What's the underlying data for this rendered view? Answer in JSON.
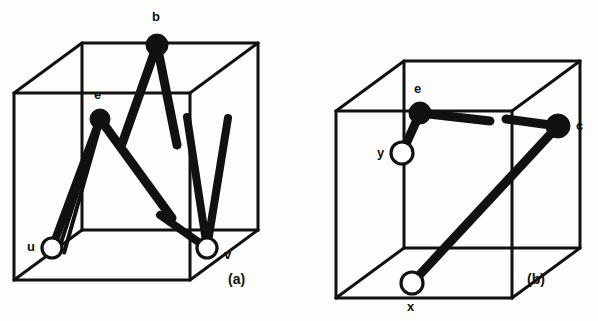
{
  "figure": {
    "title": "",
    "background_color": "#fdfdfb",
    "ink_color": "#111111",
    "panels": [
      {
        "id": "a",
        "caption": "(a)",
        "caption_pos": {
          "x": 228,
          "y": 272
        },
        "cube": {
          "front": {
            "x": 14,
            "y": 93,
            "w": 176,
            "h": 187
          },
          "depth_dx": 68,
          "depth_dy": -50,
          "stroke_width": 3
        },
        "nodes": [
          {
            "id": "b",
            "label": "b",
            "kind": "filled",
            "x": 157,
            "y": 45,
            "r": 11,
            "label_pos": {
              "x": 152,
              "y": 10
            }
          },
          {
            "id": "e",
            "label": "e",
            "kind": "filled",
            "x": 100,
            "y": 119,
            "r": 10,
            "label_pos": {
              "x": 94,
              "y": 88
            }
          },
          {
            "id": "u",
            "label": "u",
            "kind": "open",
            "x": 52,
            "y": 248,
            "r": 10,
            "label_pos": {
              "x": 27,
              "y": 240
            }
          },
          {
            "id": "v",
            "label": "v",
            "kind": "open",
            "x": 207,
            "y": 248,
            "r": 10,
            "label_pos": {
              "x": 224,
              "y": 248
            }
          }
        ],
        "edges": [
          {
            "from": "b",
            "to": [
              122,
              144
            ],
            "width": 9,
            "note": "b leg down-left"
          },
          {
            "from": "b",
            "to": [
              177,
              145
            ],
            "width": 9,
            "note": "b leg down-right"
          },
          {
            "from": "e",
            "to": [
              52,
              248
            ],
            "width": 8,
            "note": "e to u (thick)"
          },
          {
            "from": "e",
            "to": [
              52,
              248
            ],
            "width": 4,
            "offset": -7,
            "note": "e to u (second strand)"
          },
          {
            "from": "e",
            "to": [
              52,
              248
            ],
            "width": 4,
            "offset": -13,
            "note": "e to u (third strand)"
          },
          {
            "from": "e",
            "to": [
              172,
              218
            ],
            "width": 9,
            "note": "e diagonal down-right"
          },
          {
            "from": "v",
            "to": [
              187,
              117
            ],
            "width": 8,
            "note": "v up to top-right region"
          },
          {
            "from": "v",
            "to": [
              228,
              118
            ],
            "width": 8,
            "note": "v up along right face"
          },
          {
            "from": "v",
            "to": [
              160,
              215
            ],
            "width": 8,
            "note": "v short leg up-left"
          }
        ]
      },
      {
        "id": "b",
        "caption": "(b)",
        "caption_pos": {
          "x": 527,
          "y": 272
        },
        "cube": {
          "front": {
            "x": 336,
            "y": 111,
            "w": 176,
            "h": 187
          },
          "depth_dx": 68,
          "depth_dy": -50,
          "stroke_width": 3
        },
        "nodes": [
          {
            "id": "e",
            "label": "e",
            "kind": "filled",
            "x": 420,
            "y": 113,
            "r": 11,
            "label_pos": {
              "x": 414,
              "y": 82
            }
          },
          {
            "id": "y",
            "label": "y",
            "kind": "open",
            "x": 402,
            "y": 153,
            "r": 11,
            "label_pos": {
              "x": 377,
              "y": 146
            }
          },
          {
            "id": "c",
            "label": "c",
            "kind": "filled",
            "x": 558,
            "y": 126,
            "r": 12,
            "label_pos": {
              "x": 576,
              "y": 119
            }
          },
          {
            "id": "x",
            "label": "x",
            "kind": "open",
            "x": 412,
            "y": 283,
            "r": 11,
            "label_pos": {
              "x": 407,
              "y": 300
            }
          }
        ],
        "edges": [
          {
            "from": "e",
            "to": [
              402,
              153
            ],
            "width": 9,
            "note": "e to y"
          },
          {
            "from": "e",
            "to": [
              490,
              121
            ],
            "width": 9,
            "note": "e to right along top-front edge"
          },
          {
            "from": "c",
            "to": [
              506,
              119
            ],
            "width": 9,
            "note": "c to left"
          },
          {
            "from": "c",
            "to": [
              412,
              283
            ],
            "width": 9,
            "note": "c diagonal down-left to x"
          }
        ]
      }
    ]
  },
  "labels": {
    "panel_a": {
      "b": "b",
      "e": "e",
      "u": "u",
      "v": "v",
      "caption": "(a)"
    },
    "panel_b": {
      "e": "e",
      "y": "y",
      "c": "c",
      "x": "x",
      "caption": "(b)"
    }
  }
}
